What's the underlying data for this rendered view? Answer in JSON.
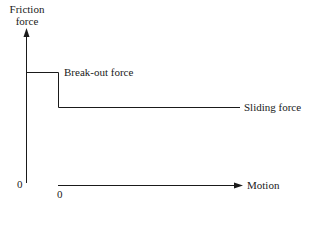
{
  "diagram": {
    "y_axis_label_line1": "Friction",
    "y_axis_label_line2": "force",
    "x_axis_label": "Motion",
    "y_origin_label": "0",
    "x_origin_label": "0",
    "breakout_label": "Break-out force",
    "sliding_label": "Sliding force",
    "line_color": "#1a1a1a"
  }
}
